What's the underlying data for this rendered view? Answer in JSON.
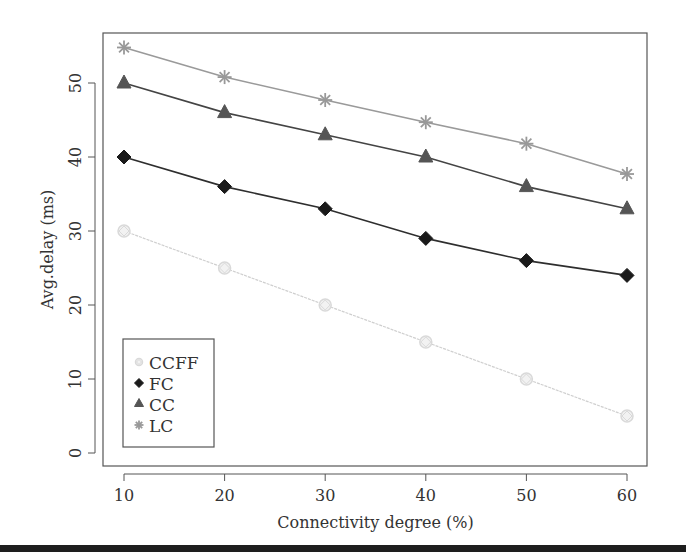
{
  "chart_data": {
    "type": "line",
    "title": "",
    "xlabel": "Connectivity degree (%)",
    "ylabel": "Avg.delay (ms)",
    "x": [
      10,
      20,
      30,
      40,
      50,
      60
    ],
    "x_ticks": [
      "10",
      "20",
      "30",
      "40",
      "50",
      "60"
    ],
    "y_ticks": [
      "0",
      "10",
      "20",
      "30",
      "40",
      "50"
    ],
    "xlim": [
      8.2,
      62
    ],
    "ylim": [
      -2.2,
      56.2
    ],
    "grid": false,
    "legend_position": "bottom-left",
    "series": [
      {
        "name": "CCFF",
        "marker": "diamond-open",
        "color": "#d9d9d9",
        "line_color": "#cfcfcf",
        "values": [
          30,
          25,
          20,
          15,
          10,
          5
        ]
      },
      {
        "name": "FC",
        "marker": "diamond",
        "color": "#1a1a1a",
        "line_color": "#2e2e2e",
        "values": [
          40,
          36,
          33,
          29,
          26,
          24
        ]
      },
      {
        "name": "CC",
        "marker": "triangle",
        "color": "#555555",
        "line_color": "#444444",
        "values": [
          50,
          46,
          43,
          40,
          36,
          33
        ]
      },
      {
        "name": "LC",
        "marker": "star",
        "color": "#999999",
        "line_color": "#9a9a9a",
        "values": [
          54.8,
          50.8,
          47.7,
          44.7,
          41.8,
          37.7
        ]
      }
    ]
  },
  "layout": {
    "plot": {
      "left": 103,
      "top": 33,
      "right": 647,
      "bottom": 466
    },
    "x_pixels": {
      "10": 124,
      "60": 627
    },
    "y_pixels": {
      "0": 453,
      "50": 83
    },
    "legend": {
      "left": 123,
      "top": 339,
      "width": 91,
      "height": 108
    }
  }
}
